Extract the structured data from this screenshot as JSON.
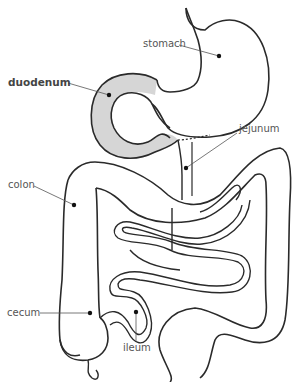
{
  "diagram": {
    "highlight_color": "#d6d6d6",
    "line_color": "#2a2a2a",
    "labels": [
      {
        "id": "stomach",
        "text": "stomach",
        "bold": false
      },
      {
        "id": "duodenum",
        "text": "duodenum",
        "bold": true
      },
      {
        "id": "jejunum",
        "text": "jejunum",
        "bold": false
      },
      {
        "id": "colon",
        "text": "colon",
        "bold": false
      },
      {
        "id": "cecum",
        "text": "cecum",
        "bold": false
      },
      {
        "id": "ileum",
        "text": "ileum",
        "bold": false
      }
    ]
  }
}
